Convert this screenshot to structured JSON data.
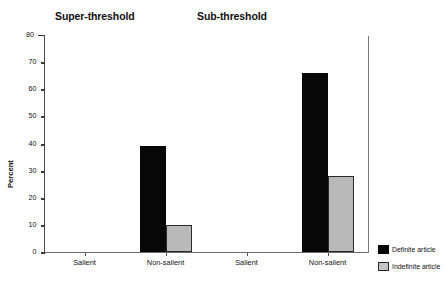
{
  "chart_data": {
    "type": "bar",
    "title": "",
    "panels": [
      {
        "title": "Super-threshold",
        "categories": [
          "Salient",
          "Non-salient"
        ],
        "series": [
          {
            "name": "Definite article",
            "values": [
              0,
              39
            ],
            "color": "#070707"
          },
          {
            "name": "Indefinite article",
            "values": [
              0,
              10
            ],
            "color": "#b9b9b9"
          }
        ]
      },
      {
        "title": "Sub-threshold",
        "categories": [
          "Salient",
          "Non-salient"
        ],
        "series": [
          {
            "name": "Definite article",
            "values": [
              0,
              66
            ],
            "color": "#070707"
          },
          {
            "name": "Indefinite article",
            "values": [
              0,
              28
            ],
            "color": "#b9b9b9"
          }
        ]
      }
    ],
    "categories": [
      "Salient",
      "Non-salient",
      "Salient",
      "Non-salient"
    ],
    "series": [
      {
        "name": "Definite article",
        "values": [
          0,
          39,
          0,
          66
        ]
      },
      {
        "name": "Indefinite article",
        "values": [
          0,
          10,
          0,
          28
        ]
      }
    ],
    "xlabel": "",
    "ylabel": "Percent",
    "ylim": [
      0,
      80
    ],
    "yticks": [
      0,
      10,
      20,
      30,
      40,
      50,
      60,
      70,
      80
    ],
    "ytick_labels": [
      "0",
      "10",
      "20",
      "30",
      "40",
      "50",
      "60",
      "70",
      "80"
    ],
    "grid": false,
    "legend": {
      "position": "right-bottom",
      "entries": [
        {
          "label": "Definite article",
          "color": "#070707"
        },
        {
          "label": "Indefinite article",
          "color": "#c3c3c3"
        }
      ]
    }
  }
}
